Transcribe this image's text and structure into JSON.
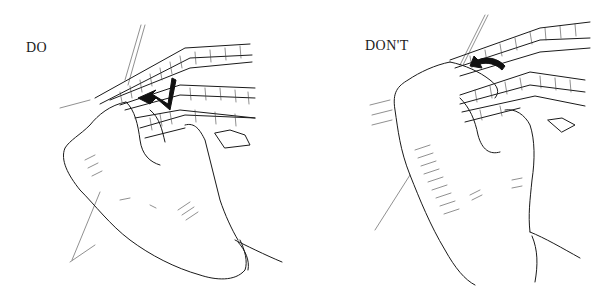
{
  "figure": {
    "type": "instructional-illustration",
    "panels": [
      {
        "id": "do",
        "label": "DO",
        "depicts": "hand gripping stacked wire mesh panels, arrow showing correct lift direction"
      },
      {
        "id": "dont",
        "label": "DON'T",
        "depicts": "hand gripping stacked wire mesh panels, curved arrow showing incorrect motion"
      }
    ],
    "colors": {
      "background": "#ffffff",
      "ink": "#1a1a1a"
    }
  }
}
